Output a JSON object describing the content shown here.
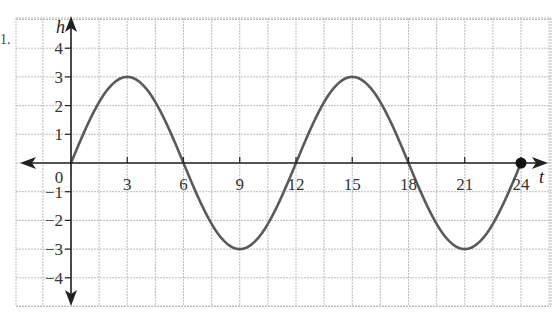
{
  "problem": {
    "label": "1."
  },
  "chart_data": {
    "type": "line",
    "title": "",
    "xlabel": "t",
    "ylabel": "h",
    "x_ticks": [
      0,
      3,
      6,
      9,
      12,
      15,
      18,
      21,
      24
    ],
    "x_tick_labels": [
      "0",
      "3",
      "6",
      "9",
      "12",
      "15",
      "18",
      "21",
      "24"
    ],
    "y_ticks": [
      4,
      3,
      2,
      1,
      -1,
      -2,
      -3,
      -4
    ],
    "y_tick_labels": [
      "4",
      "3",
      "2",
      "1",
      "−1",
      "−2",
      "−3",
      "−4"
    ],
    "xlim": [
      -3,
      25.5
    ],
    "ylim": [
      -4.8,
      5
    ],
    "grid": true,
    "function": "h = 3 sin(pi t / 6)",
    "series": [
      {
        "name": "h(t)",
        "x": [
          0,
          3,
          6,
          9,
          12,
          15,
          18,
          21,
          24
        ],
        "values": [
          0,
          3,
          0,
          -3,
          0,
          3,
          0,
          -3,
          0
        ]
      }
    ],
    "annotations": [
      {
        "type": "endpoint-dot",
        "x": 24,
        "y": 0
      }
    ],
    "colors": {
      "curve": "#5a5a5a",
      "axes": "#222222",
      "grid": "#bdbdbd"
    }
  }
}
